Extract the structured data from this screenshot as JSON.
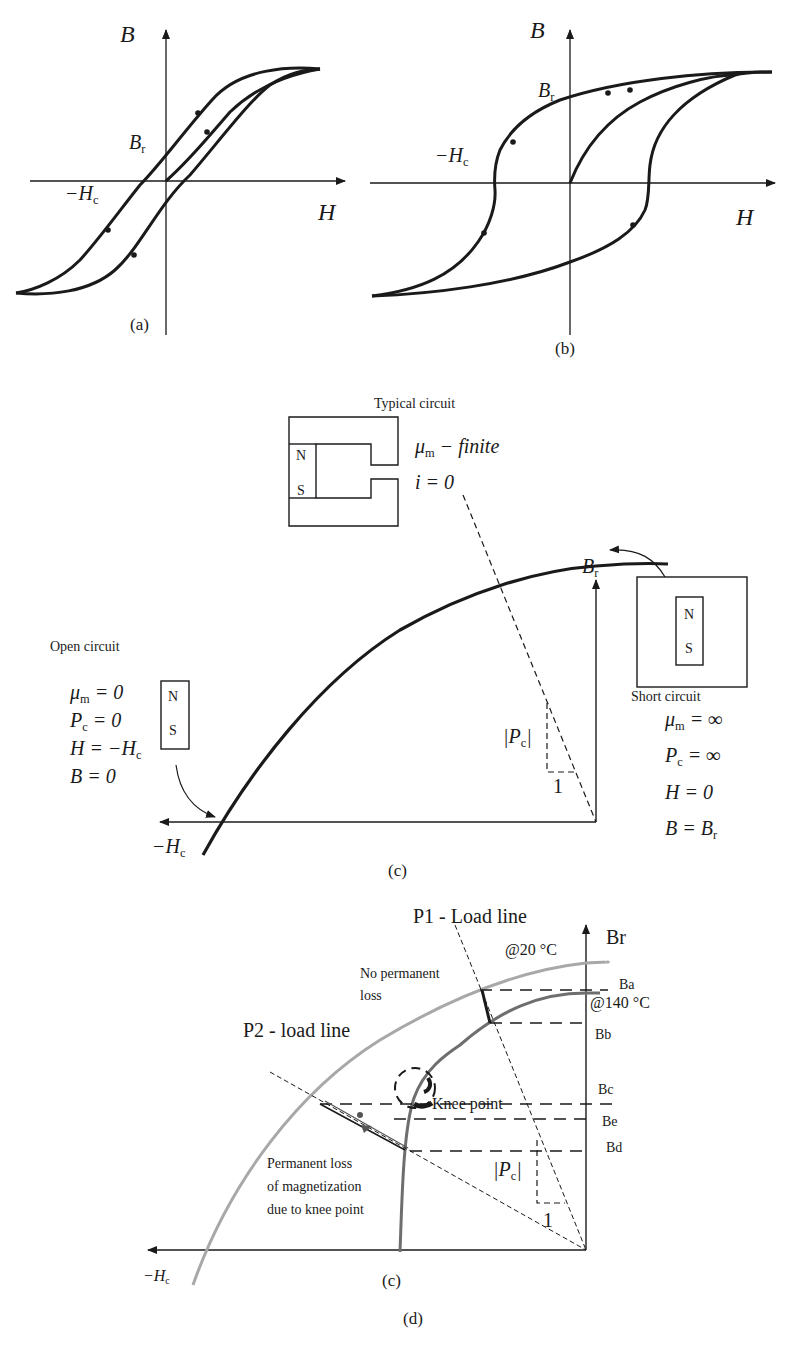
{
  "panel_a": {
    "caption": "(a)",
    "y_axis": "B",
    "x_axis": "H",
    "remanence_label": "B",
    "remanence_sub": "r",
    "coercivity_label": "−H",
    "coercivity_sub": "c"
  },
  "panel_b": {
    "caption": "(b)",
    "y_axis": "B",
    "x_axis": "H",
    "remanence_label": "B",
    "remanence_sub": "r",
    "coercivity_label": "−H",
    "coercivity_sub": "c"
  },
  "panel_c": {
    "caption": "(c)",
    "typical": {
      "title": "Typical circuit",
      "mu_label": "μ",
      "mu_sub": "m",
      "mu_value": " − finite",
      "current": "i = 0",
      "pole_n": "N",
      "pole_s": "S"
    },
    "remanence_label": "B",
    "remanence_sub": "r",
    "short": {
      "title": "Short circuit",
      "pole_n": "N",
      "pole_s": "S",
      "eq1_main": "μ",
      "eq1_sub": "m",
      "eq1_rest": " = ∞",
      "eq2_main": "P",
      "eq2_sub": "c",
      "eq2_rest": " = ∞",
      "eq3": "H = 0",
      "eq4_main": "B = B",
      "eq4_sub": "r"
    },
    "open": {
      "title": "Open circuit",
      "pole_n": "N",
      "pole_s": "S",
      "eq1_main": "μ",
      "eq1_sub": "m",
      "eq1_rest": " = 0",
      "eq2_main": "P",
      "eq2_sub": "c",
      "eq2_rest": " = 0",
      "eq3_main": "H = −H",
      "eq3_sub": "c",
      "eq4": "B = 0"
    },
    "permeance_label": "|P",
    "permeance_sub": "c",
    "permeance_close": "|",
    "slope_unit": "1",
    "coercivity_label": "−H",
    "coercivity_sub": "c"
  },
  "panel_d": {
    "caption_inner": "(c)",
    "caption": "(d)",
    "p1_label": "P1 - Load line",
    "p2_label": "P2 - load line",
    "br_label": "Br",
    "temp_20": "@20 °C",
    "temp_140": "@140 °C",
    "no_loss_line1": "No permanent",
    "no_loss_line2": "loss",
    "knee_label": "Knee point",
    "perm_loss_line1": "Permanent loss",
    "perm_loss_line2": "of magnetization",
    "perm_loss_line3": "due to knee point",
    "levels": [
      "Ba",
      "Bb",
      "Bc",
      "Be",
      "Bd"
    ],
    "permeance_label": "|P",
    "permeance_sub": "c",
    "permeance_close": "|",
    "slope_unit": "1",
    "coercivity_label": "−H",
    "coercivity_sub": "c",
    "colors": {
      "curve_20C": "#a8a8a8",
      "curve_140C": "#6e6e6e",
      "ink": "#1a1a1a"
    }
  }
}
